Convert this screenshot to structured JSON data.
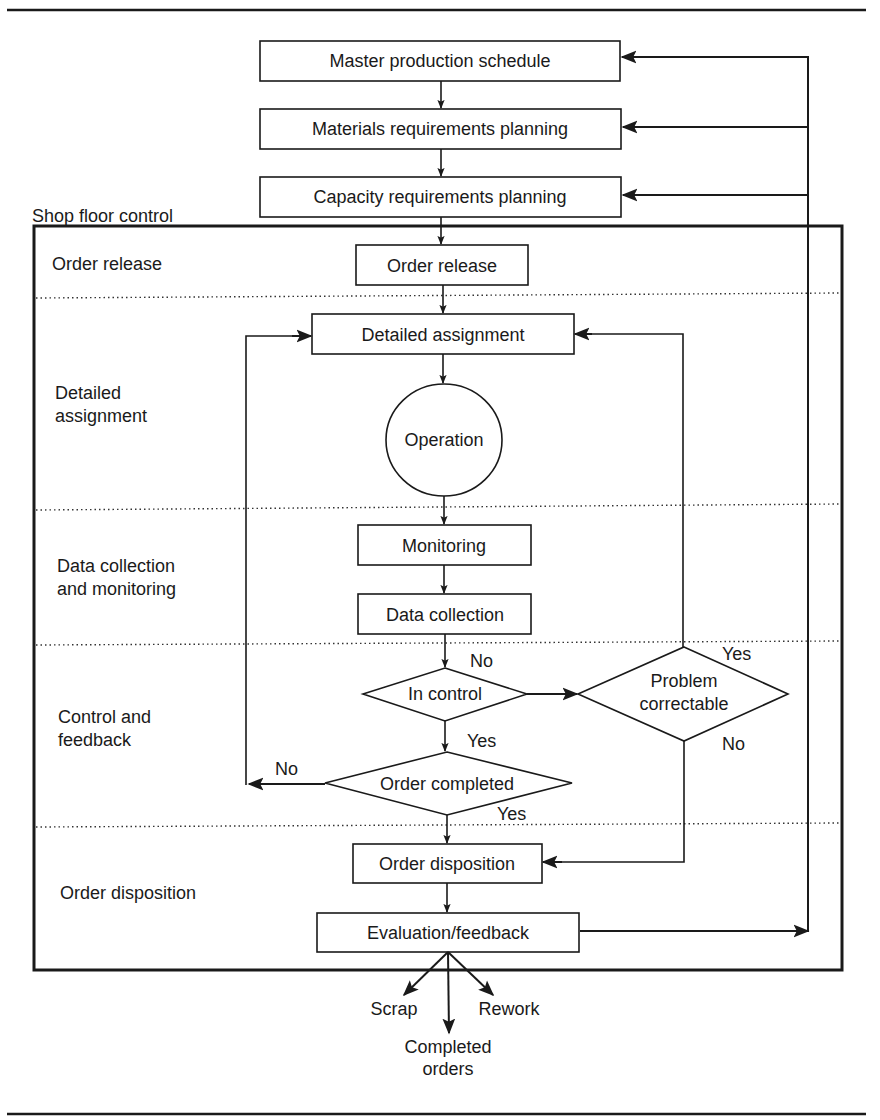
{
  "diagram": {
    "type": "flowchart",
    "top_boxes": [
      {
        "id": "mps",
        "label": "Master production schedule"
      },
      {
        "id": "mrp",
        "label": "Materials requirements planning"
      },
      {
        "id": "crp",
        "label": "Capacity requirements planning"
      }
    ],
    "container": {
      "label": "Shop floor control"
    },
    "lanes": [
      {
        "id": "order-release",
        "lines": [
          "Order release"
        ]
      },
      {
        "id": "detailed-assignment",
        "lines": [
          "Detailed",
          "assignment"
        ]
      },
      {
        "id": "data-collection",
        "lines": [
          "Data collection",
          "and monitoring"
        ]
      },
      {
        "id": "control-feedback",
        "lines": [
          "Control and",
          "feedback"
        ]
      },
      {
        "id": "order-disposition",
        "lines": [
          "Order disposition"
        ]
      }
    ],
    "nodes": {
      "order_release": "Order release",
      "detailed_assignment": "Detailed assignment",
      "operation": "Operation",
      "monitoring": "Monitoring",
      "data_collection": "Data collection",
      "in_control": "In control",
      "problem_correctable": [
        "Problem",
        "correctable"
      ],
      "order_completed": "Order completed",
      "order_disposition": "Order disposition",
      "evaluation_feedback": "Evaluation/feedback"
    },
    "edge_labels": {
      "in_control_no": "No",
      "in_control_yes": "Yes",
      "problem_yes": "Yes",
      "problem_no": "No",
      "order_completed_no": "No",
      "order_completed_yes": "Yes"
    },
    "outputs": {
      "scrap": "Scrap",
      "rework": "Rework",
      "completed": [
        "Completed",
        "orders"
      ]
    }
  }
}
